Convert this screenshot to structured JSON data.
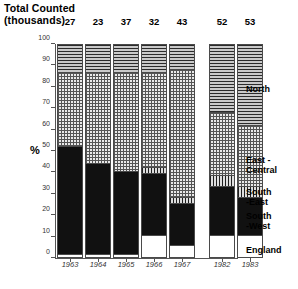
{
  "header": {
    "title_line1": "Total Counted",
    "title_line2": "(thousands)"
  },
  "axis": {
    "ylabel": "%",
    "yticks": [
      "0",
      "10",
      "20",
      "30",
      "40",
      "50",
      "60",
      "70",
      "80",
      "90",
      "100"
    ]
  },
  "legend": [
    {
      "key": "north",
      "label": "North"
    },
    {
      "key": "east_central",
      "label": "East -\nCentral"
    },
    {
      "key": "south_east",
      "label": "South\n-East"
    },
    {
      "key": "south_west",
      "label": "South\n-West"
    },
    {
      "key": "england",
      "label": "England"
    }
  ],
  "caption": "",
  "chart_data": {
    "type": "bar",
    "title": "Total Counted (thousands)",
    "xlabel": "",
    "ylabel": "%",
    "ylim": [
      0,
      100
    ],
    "stacked": true,
    "grid": false,
    "legend_position": "right",
    "categories": [
      "1963",
      "1964",
      "1965",
      "1966",
      "1967",
      "1982",
      "1983"
    ],
    "totals_counted_thousands": [
      27,
      23,
      37,
      32,
      43,
      52,
      53
    ],
    "series": [
      {
        "name": "England",
        "values": [
          1,
          1,
          1,
          10,
          5,
          10,
          10
        ]
      },
      {
        "name": "South -West",
        "values": [
          51,
          43,
          39,
          29,
          20,
          23,
          18
        ]
      },
      {
        "name": "South -East",
        "values": [
          0,
          0,
          0,
          3,
          3,
          5,
          5
        ]
      },
      {
        "name": "East - Central",
        "values": [
          35,
          43,
          47,
          45,
          60,
          30,
          29
        ]
      },
      {
        "name": "North",
        "values": [
          13,
          13,
          13,
          13,
          12,
          32,
          38
        ]
      }
    ]
  }
}
